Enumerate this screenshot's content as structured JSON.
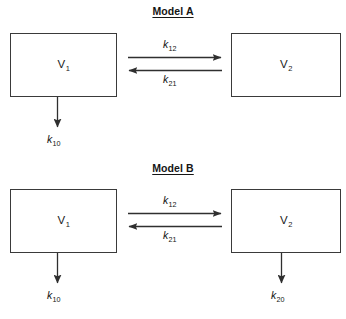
{
  "figure": {
    "title": "",
    "background_color": "#ffffff",
    "line_color": "#3a3a3a",
    "text_color": "#1a1a1a"
  },
  "models": [
    {
      "id": "model-a",
      "title": "Model A",
      "compartments": [
        {
          "id": "v1",
          "symbol": "V",
          "subscript": "1",
          "label": "V1"
        },
        {
          "id": "v2",
          "symbol": "V",
          "subscript": "2",
          "label": "V2"
        }
      ],
      "rate_constants": [
        {
          "id": "k12",
          "symbol": "k",
          "subscript": "12",
          "label": "k12",
          "direction": "v1-to-v2",
          "position": "above-arrow"
        },
        {
          "id": "k21",
          "symbol": "k",
          "subscript": "21",
          "label": "k21",
          "direction": "v2-to-v1",
          "position": "below-arrow"
        },
        {
          "id": "k10",
          "symbol": "k",
          "subscript": "10",
          "label": "k10",
          "direction": "v1-elimination",
          "position": "below-box"
        }
      ]
    },
    {
      "id": "model-b",
      "title": "Model B",
      "compartments": [
        {
          "id": "v1",
          "symbol": "V",
          "subscript": "1",
          "label": "V1"
        },
        {
          "id": "v2",
          "symbol": "V",
          "subscript": "2",
          "label": "V2"
        }
      ],
      "rate_constants": [
        {
          "id": "k12",
          "symbol": "k",
          "subscript": "12",
          "label": "k12",
          "direction": "v1-to-v2",
          "position": "above-arrow"
        },
        {
          "id": "k21",
          "symbol": "k",
          "subscript": "21",
          "label": "k21",
          "direction": "v2-to-v1",
          "position": "below-arrow"
        },
        {
          "id": "k10",
          "symbol": "k",
          "subscript": "10",
          "label": "k10",
          "direction": "v1-elimination",
          "position": "below-box"
        },
        {
          "id": "k20",
          "symbol": "k",
          "subscript": "20",
          "label": "k20",
          "direction": "v2-elimination",
          "position": "below-box"
        }
      ]
    }
  ]
}
